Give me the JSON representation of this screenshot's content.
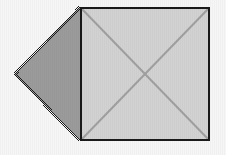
{
  "canvas": {
    "width": 226,
    "height": 155,
    "background_color": "#f6f6f6",
    "texture": "faint-vertical-stripes"
  },
  "figure": {
    "title": "square-with-attached-triangle",
    "shapes": [
      {
        "id": "triangle",
        "name": "left-pointing-triangle",
        "kind": "triangle",
        "fill_color": "#9b9b9b",
        "edge_style": "dithered",
        "edge_color": "#1a1a1a",
        "points": [
          [
            15,
            74
          ],
          [
            80,
            7
          ],
          [
            80,
            141
          ]
        ]
      },
      {
        "id": "square",
        "name": "outlined-square",
        "kind": "rectangle",
        "fill_color": "#d2d2d2",
        "stroke_color": "#1a1a1a",
        "stroke_width": 2,
        "x": 80,
        "y": 7,
        "width": 130,
        "height": 134
      },
      {
        "id": "diagonal-1",
        "name": "square-diagonal-tl-br",
        "kind": "line",
        "stroke_color": "#a0a0a0",
        "stroke_width": 2,
        "from": [
          81,
          8
        ],
        "to": [
          209,
          140
        ]
      },
      {
        "id": "diagonal-2",
        "name": "square-diagonal-bl-tr",
        "kind": "line",
        "stroke_color": "#a0a0a0",
        "stroke_width": 2,
        "from": [
          81,
          140
        ],
        "to": [
          209,
          8
        ]
      }
    ],
    "vertices": {
      "triangle_apex": "(15, 74)",
      "square_top_left": "(80, 7)",
      "square_top_right": "(210, 7)",
      "square_bottom_left": "(80, 141)",
      "square_bottom_right": "(210, 141)",
      "diagonal_intersection": "(145, 74)"
    },
    "colors": {
      "triangle_fill": "#9b9b9b",
      "square_fill": "#d2d2d2",
      "outline": "#1a1a1a",
      "diagonal": "#a0a0a0",
      "background": "#f6f6f6"
    }
  }
}
